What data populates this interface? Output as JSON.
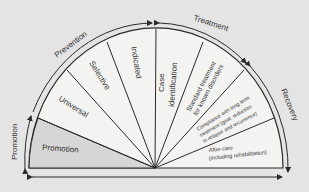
{
  "diagram": {
    "arc_labels": {
      "promotion": "Promotion",
      "prevention": "Prevention",
      "treatment": "Treatment",
      "recovery": "Recovery"
    },
    "segments": {
      "promotion": "Promotion",
      "universal": "Universal",
      "selective": "Selective",
      "indicated": "Indicated",
      "case_identification_1": "Case",
      "case_identification_2": "identification",
      "standard_treatment_1": "Standard treatment",
      "standard_treatment_2": "for known disorders",
      "compliance_1": "Compliance with long term",
      "compliance_2": "treatment (goal: reduction",
      "compliance_3": "in relapse and recurrence)",
      "aftercare_1": "After-care",
      "aftercare_2": "(including rehabilitation)"
    },
    "colors": {
      "background": "#e4e4e4",
      "fan": "#f3f3f1",
      "promotion_fill": "#d6d6d6",
      "line": "#2a2a2a"
    }
  }
}
